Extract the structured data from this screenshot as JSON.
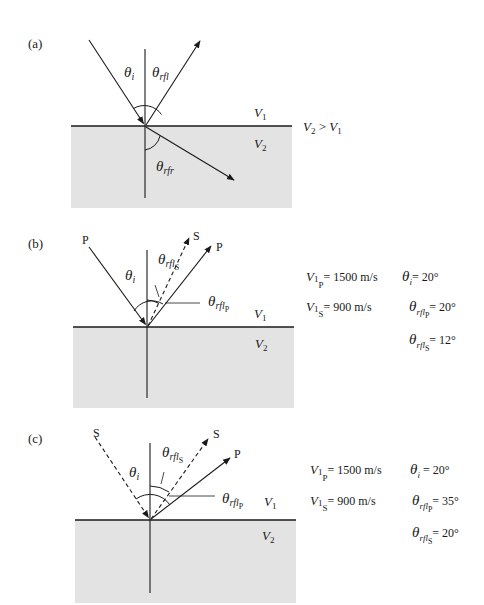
{
  "colors": {
    "background": "#ffffff",
    "medium2_fill": "#e3e3e3",
    "ink": "#1a1a1a"
  },
  "panels": [
    {
      "id": "a",
      "label": "(a)",
      "layer_labels": {
        "upper": "V",
        "upper_sub": "1",
        "lower": "V",
        "lower_sub": "2"
      },
      "relation": {
        "lhs": "V",
        "lhs_sub": "2",
        "op": " > ",
        "rhs": "V",
        "rhs_sub": "1"
      },
      "angles": {
        "incident": {
          "sym": "θ",
          "sub": "i"
        },
        "reflected": {
          "sym": "θ",
          "sub": "rfl"
        },
        "refracted": {
          "sym": "θ",
          "sub": "rfr"
        }
      }
    },
    {
      "id": "b",
      "label": "(b)",
      "ray_labels": {
        "incident": "P",
        "reflected_s": "S",
        "reflected_p": "P"
      },
      "layer_labels": {
        "upper": "V",
        "upper_sub": "1",
        "lower": "V",
        "lower_sub": "2"
      },
      "angles": {
        "incident": {
          "sym": "θ",
          "sub": "i"
        },
        "reflected_s": {
          "sym": "θ",
          "sub": "rfl",
          "subsub": "S"
        },
        "reflected_p": {
          "sym": "θ",
          "sub": "rfl",
          "subsub": "P"
        }
      },
      "params": {
        "v1p": {
          "sym": "V",
          "sub": "1",
          "subsub": "P",
          "value": "= 1500 m/s"
        },
        "v1s": {
          "sym": "V",
          "sub": "1",
          "subsub": "S",
          "value": "= 900 m/s"
        },
        "theta_i": {
          "sym": "θ",
          "sub": "i",
          "value": "= 20°"
        },
        "theta_rfl_p": {
          "sym": "θ",
          "sub": "rfl",
          "subsub": "P",
          "value": "= 20°"
        },
        "theta_rfl_s": {
          "sym": "θ",
          "sub": "rfl",
          "subsub": "S",
          "value": "= 12°"
        }
      }
    },
    {
      "id": "c",
      "label": "(c)",
      "ray_labels": {
        "incident": "S",
        "reflected_s": "S",
        "reflected_p": "P"
      },
      "layer_labels": {
        "upper": "V",
        "upper_sub": "1",
        "lower": "V",
        "lower_sub": "2"
      },
      "angles": {
        "incident": {
          "sym": "θ",
          "sub": "i"
        },
        "reflected_s": {
          "sym": "θ",
          "sub": "rfl",
          "subsub": "S"
        },
        "reflected_p": {
          "sym": "θ",
          "sub": "rfl",
          "subsub": "P"
        }
      },
      "params": {
        "v1p": {
          "sym": "V",
          "sub": "1",
          "subsub": "P",
          "value": "= 1500 m/s"
        },
        "v1s": {
          "sym": "V",
          "sub": "1",
          "subsub": "S",
          "value": "= 900 m/s"
        },
        "theta_i": {
          "sym": "θ",
          "sub": "i",
          "value": "= 20°"
        },
        "theta_rfl_p": {
          "sym": "θ",
          "sub": "rfl",
          "subsub": "P",
          "value": "= 35°"
        },
        "theta_rfl_s": {
          "sym": "θ",
          "sub": "rfl",
          "subsub": "S",
          "value": "= 20°"
        }
      }
    }
  ]
}
